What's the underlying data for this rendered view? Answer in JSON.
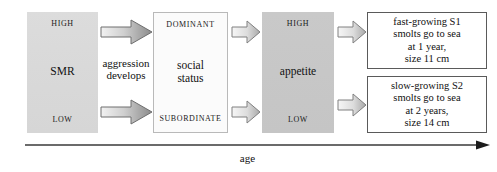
{
  "diagram": {
    "axis": {
      "label": "age",
      "direction": "left-to-right"
    },
    "stages": [
      {
        "id": "smr",
        "top_label": "HIGH",
        "middle_label": "SMR",
        "bottom_label": "LOW",
        "fill": "#d9d9d9"
      },
      {
        "id": "social-status",
        "top_label": "DOMINANT",
        "middle_label_line1": "social",
        "middle_label_line2": "status",
        "bottom_label": "SUBORDINATE",
        "fill": "#fbfbfb"
      },
      {
        "id": "appetite",
        "top_label": "HIGH",
        "middle_label": "appetite",
        "bottom_label": "LOW",
        "fill": "#c7c7c7"
      }
    ],
    "connector_label": {
      "line1": "aggression",
      "line2": "develops"
    },
    "outcomes": [
      {
        "id": "s1",
        "line1": "fast-growing S1",
        "line2": "smolts go to sea",
        "line3": "at 1 year,",
        "line4": "size 11 cm"
      },
      {
        "id": "s2",
        "line1": "slow-growing S2",
        "line2": "smolts go to sea",
        "line3": "at 2 years,",
        "line4": "size 14 cm"
      }
    ],
    "arrows": [
      {
        "id": "smr-to-status-upper",
        "style": "gradient-block",
        "direction": "right"
      },
      {
        "id": "smr-to-status-lower",
        "style": "gradient-block",
        "direction": "right"
      },
      {
        "id": "status-to-appetite-upper",
        "style": "outline-block",
        "direction": "right"
      },
      {
        "id": "status-to-appetite-lower",
        "style": "outline-block",
        "direction": "right"
      },
      {
        "id": "appetite-to-s1",
        "style": "outline-block",
        "direction": "right"
      },
      {
        "id": "appetite-to-s2",
        "style": "outline-block",
        "direction": "right"
      }
    ],
    "colors": {
      "background": "#ffffff",
      "smr_fill": "#d9d9d9",
      "status_fill": "#fbfbfb",
      "appetite_fill": "#c7c7c7",
      "outcome_border": "#5a5a5a",
      "axis_line": "#3a3a3a",
      "text": "#111111"
    }
  }
}
